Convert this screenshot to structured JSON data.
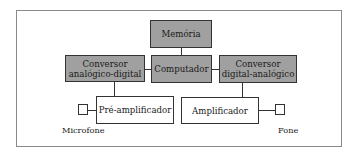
{
  "diagram": {
    "nodes": {
      "memoria": {
        "label": "Memória"
      },
      "computador": {
        "label": "Computador"
      },
      "adc": {
        "line1": "Conversor",
        "line2": "analógico-digital"
      },
      "dac": {
        "line1": "Conversor",
        "line2": "digital-analógico"
      },
      "preamp": {
        "label": "Pré-amplificador"
      },
      "amp": {
        "label": "Amplificador"
      }
    },
    "endpoints": {
      "microfone": {
        "label": "Microfone"
      },
      "fone": {
        "label": "Fone"
      }
    },
    "colors": {
      "processing_fill": "#a0a0a0",
      "analog_fill": "#ffffff",
      "stroke": "#333333"
    },
    "edges": [
      [
        "Memória",
        "Computador"
      ],
      [
        "Conversor analógico-digital",
        "Computador"
      ],
      [
        "Computador",
        "Conversor digital-analógico"
      ],
      [
        "Conversor analógico-digital",
        "Pré-amplificador"
      ],
      [
        "Conversor digital-analógico",
        "Amplificador"
      ],
      [
        "Microfone",
        "Pré-amplificador"
      ],
      [
        "Amplificador",
        "Fone"
      ]
    ]
  }
}
